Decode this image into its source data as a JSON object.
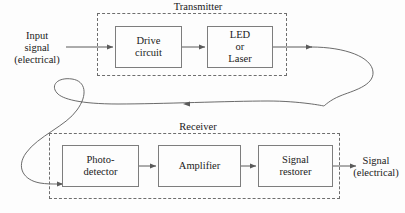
{
  "figure": {
    "background_color": "#fdfdfd",
    "line_color": "#5a5a5a",
    "box_border_color": "#7d7d7d",
    "dashed_border_color": "#6e6e6e",
    "text_color": "#1a1a1a"
  },
  "input": {
    "line1": "Input",
    "line2": "signal",
    "line3": "(electrical)"
  },
  "transmitter": {
    "title": "Transmitter",
    "blocks": [
      {
        "id": "drive-circuit",
        "line1": "Drive",
        "line2": "circuit"
      },
      {
        "id": "led-or-laser",
        "line1": "LED",
        "line2": "or",
        "line3": "Laser"
      }
    ]
  },
  "fiber": {
    "name": "optical-fiber-link"
  },
  "receiver": {
    "title": "Receiver",
    "blocks": [
      {
        "id": "photodetector",
        "line1": "Photo-",
        "line2": "detector"
      },
      {
        "id": "amplifier",
        "line1": "Amplifier",
        "line2": ""
      },
      {
        "id": "signal-restorer",
        "line1": "Signal",
        "line2": "restorer"
      }
    ]
  },
  "output": {
    "line1": "Signal",
    "line2": "(electrical)"
  },
  "caption": {
    "text": ""
  }
}
